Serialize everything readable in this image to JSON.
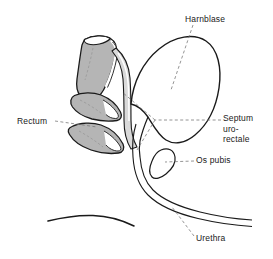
{
  "figure": {
    "kind": "anatomical-line-drawing",
    "language": "de",
    "background_color": "#ffffff",
    "ink_color": "#1a1a1a",
    "organ_fill_gray": "#b5b5b5",
    "organ_fill_light": "#d9d9d9",
    "leader_line_color": "#7a7a7a"
  },
  "labels": [
    {
      "id": "harnblase",
      "text": "Harnblase",
      "meaning": "urinary bladder",
      "position": "top-right"
    },
    {
      "id": "rectum",
      "text": "Rectum",
      "meaning": "rectum",
      "position": "left"
    },
    {
      "id": "septum",
      "text": "Septum\nuro-\nrectale",
      "line1": "Septum",
      "line2": "uro-",
      "line3": "rectale",
      "meaning": "urorectal septum",
      "position": "right"
    },
    {
      "id": "os_pubis",
      "text": "Os pubis",
      "meaning": "pubic bone",
      "position": "right"
    },
    {
      "id": "urethra",
      "text": "Urethra",
      "meaning": "urethra",
      "position": "bottom-right"
    }
  ],
  "structures": [
    {
      "id": "bladder",
      "name": "Harnblase",
      "fill": "#ffffff"
    },
    {
      "id": "rectum",
      "name": "Rectum",
      "fill": "#b5b5b5"
    },
    {
      "id": "septum",
      "name": "Septum urorectale",
      "fill": "#d9d9d9"
    },
    {
      "id": "os-pubis",
      "name": "Os pubis",
      "fill": "#ffffff"
    },
    {
      "id": "urethra",
      "name": "Urethra",
      "fill": "#ffffff"
    },
    {
      "id": "body-contour",
      "name": "body surface contour",
      "fill": "none"
    }
  ]
}
